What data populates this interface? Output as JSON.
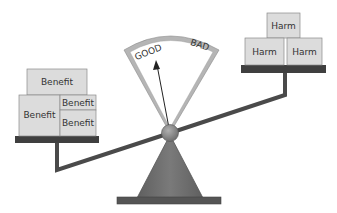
{
  "diagram": {
    "type": "balance-scale",
    "gauge": {
      "left_label": "GOOD",
      "right_label": "BAD",
      "needle_points_to": "GOOD"
    },
    "left_pan": {
      "boxes": [
        {
          "label": "Benefit",
          "position": "top"
        },
        {
          "label": "Benefit",
          "position": "bottom-left-large"
        },
        {
          "label": "Benefit",
          "position": "bottom-right-upper"
        },
        {
          "label": "Benefit",
          "position": "bottom-right-lower"
        }
      ]
    },
    "right_pan": {
      "boxes": [
        {
          "label": "Harm",
          "position": "top"
        },
        {
          "label": "Harm",
          "position": "bottom-left"
        },
        {
          "label": "Harm",
          "position": "bottom-right"
        }
      ]
    },
    "colors": {
      "box_fill": "#dcdcdc",
      "box_stroke": "#8a8a8a",
      "beam": "#4a4a4a",
      "platform": "#3f3f3f",
      "base": "#6e6e6e",
      "pivot": "#8c8c8c",
      "gauge_frame": "#b5b5b5"
    }
  }
}
